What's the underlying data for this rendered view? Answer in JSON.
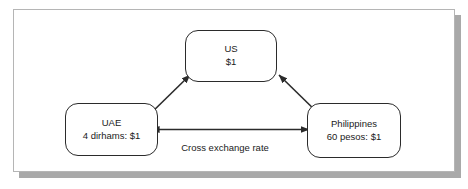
{
  "figure": {
    "kind": "cross-exchange-rate-diagram",
    "frame": {
      "border_color": "#b5b5b5",
      "shadow_color": "#a9a9a9",
      "background": "#ffffff"
    },
    "line_color": "#2b2b2b",
    "text_color": "#1a1a1a"
  },
  "nodes": {
    "us": {
      "name": "US",
      "rate": "$1"
    },
    "uae": {
      "name": "UAE",
      "rate": "4 dirhams: $1"
    },
    "philippines": {
      "name": "Philippines",
      "rate": "60 pesos: $1"
    }
  },
  "edges": {
    "uae_to_us": {
      "label": "",
      "arrowheads": "end"
    },
    "philippines_to_us": {
      "label": "",
      "arrowheads": "end"
    },
    "uae_philippines": {
      "label": "Cross exchange rate",
      "arrowheads": "both"
    }
  }
}
